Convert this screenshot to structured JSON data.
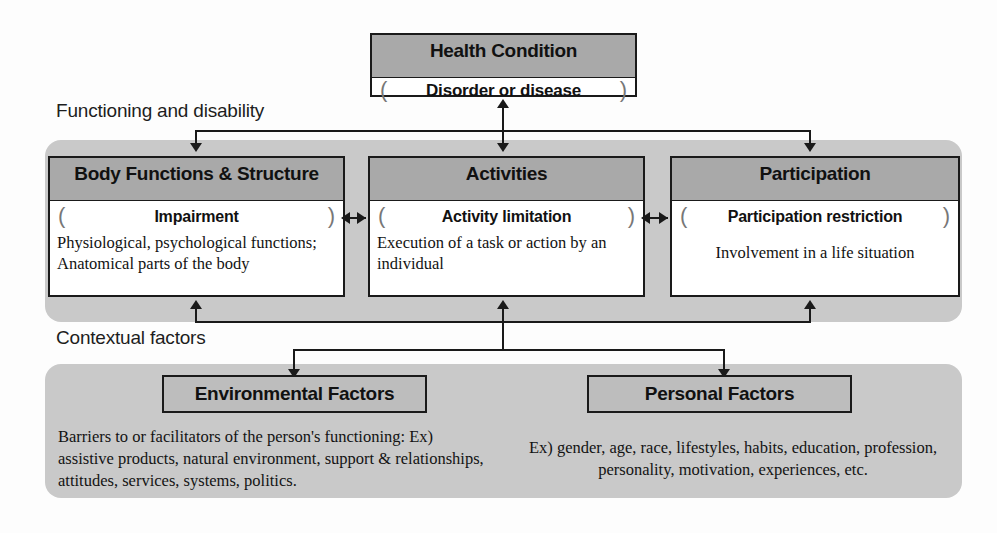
{
  "diagram": {
    "title_box": {
      "header": "Health Condition",
      "qualifier": "Disorder or disease",
      "bracket_left": "(",
      "bracket_right": ")"
    },
    "regions": [
      {
        "caption": "Functioning and disability"
      },
      {
        "caption": "Contextual factors"
      }
    ],
    "components": [
      {
        "header": "Body Functions & Structure",
        "qualifier": "Impairment",
        "bracket_left": "(",
        "bracket_right": ")",
        "description": "Physiological, psychological functions; Anatomical parts of the body"
      },
      {
        "header": "Activities",
        "qualifier": "Activity limitation",
        "bracket_left": "(",
        "bracket_right": ")",
        "description": "Execution of a task or action by an individual"
      },
      {
        "header": "Participation",
        "qualifier": "Participation restriction",
        "bracket_left": "(",
        "bracket_right": ")",
        "description": "Involvement in a life situation"
      }
    ],
    "contextual_factors": [
      {
        "header": "Environmental Factors",
        "description": "Barriers to or facilitators of the person's functioning: Ex) assistive products, natural environment, support & relationships, attitudes, services, systems, politics."
      },
      {
        "header": "Personal Factors",
        "description": "Ex) gender, age, race, lifestyles, habits, education, profession, personality, motivation, experiences, etc."
      }
    ],
    "colors": {
      "panel_grey": "#c9c9c9",
      "header_grey": "#a9a9a9",
      "factor_grey": "#bdbdbd",
      "line_black": "#1a1a1a",
      "box_white": "#ffffff"
    }
  }
}
